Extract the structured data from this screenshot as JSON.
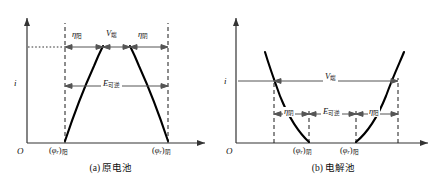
{
  "figure": {
    "type": "diagram",
    "colors": {
      "axis": "#333333",
      "curve": "#000000",
      "dashed": "#1a1a1a",
      "arrow": "#555555",
      "text": "#111111",
      "background": "#ffffff"
    }
  },
  "panels": [
    {
      "id": "a",
      "caption": "(a) 原电池",
      "axes": {
        "origin_label": "O",
        "y_axis_label": "i",
        "x_axis_label": ""
      },
      "x_ticks": [
        {
          "label_main": "(φ",
          "label_sub_italic": "r",
          "label_close": ")",
          "label_sub": "阳"
        },
        {
          "label_main": "(φ",
          "label_sub_italic": "r",
          "label_close": ")",
          "label_sub": "阴"
        }
      ],
      "tick_text": {
        "left": "(φr)阳",
        "right": "(φr)阴"
      },
      "annotations": [
        {
          "name": "eta-anode",
          "symbol": "η",
          "subscript": "阳",
          "row": "top"
        },
        {
          "name": "terminal-voltage",
          "symbol": "V",
          "subscript": "端",
          "row": "top"
        },
        {
          "name": "eta-cathode",
          "symbol": "η",
          "subscript": "阴",
          "row": "top"
        },
        {
          "name": "reversible-emf",
          "symbol": "E",
          "subscript": "可逆",
          "row": "middle"
        }
      ]
    },
    {
      "id": "b",
      "caption": "(b) 电解池",
      "axes": {
        "origin_label": "O",
        "y_axis_label": "i",
        "x_axis_label": ""
      },
      "tick_text": {
        "left": "(φr)阴",
        "right": "(φr)阳"
      },
      "annotations": [
        {
          "name": "terminal-voltage",
          "symbol": "V",
          "subscript": "端",
          "row": "top"
        },
        {
          "name": "eta-cathode",
          "symbol": "η",
          "subscript": "阴",
          "row": "middle"
        },
        {
          "name": "reversible-emf",
          "symbol": "E",
          "subscript": "可逆",
          "row": "middle"
        },
        {
          "name": "eta-anode",
          "symbol": "η",
          "subscript": "阳",
          "row": "middle"
        }
      ]
    }
  ],
  "text": {
    "origin": "O",
    "i": "i",
    "eta": "η",
    "V": "V",
    "E": "E",
    "phi": "φ",
    "r": "r",
    "paren_open": "(",
    "paren_close": ")",
    "sub_anode": "阳",
    "sub_cathode": "阴",
    "sub_terminal": "端",
    "sub_reversible": "可逆",
    "caption_a": "(a) 原电池",
    "caption_b": "(b) 电解池"
  }
}
